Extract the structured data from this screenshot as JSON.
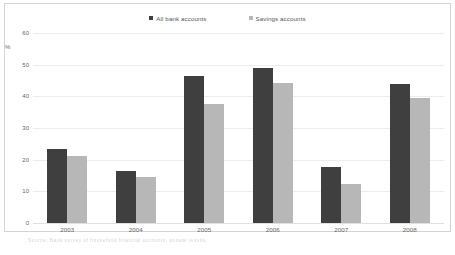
{
  "chart_data": {
    "type": "bar",
    "title": "",
    "subtitle": "",
    "xlabel": "",
    "ylabel": "%",
    "categories": [
      "2003",
      "2004",
      "2005",
      "2006",
      "2007",
      "2008"
    ],
    "series": [
      {
        "name": "All bank accounts",
        "color": "#3f3f3f",
        "values": [
          23.5,
          16.5,
          46.4,
          49.0,
          17.8,
          44.0
        ]
      },
      {
        "name": "Savings accounts",
        "color": "#b7b7b7",
        "values": [
          21.3,
          14.5,
          37.7,
          44.2,
          12.4,
          39.6
        ]
      }
    ],
    "ylim": [
      0,
      60
    ],
    "yticks": [
      0,
      10,
      20,
      30,
      40,
      50,
      60
    ],
    "ytick_labels": [
      "0",
      "10",
      "20",
      "30",
      "40",
      "50",
      "60"
    ],
    "grid": true,
    "legend_position": "top-center"
  },
  "legend": {
    "items": [
      {
        "label": "All bank accounts",
        "color": "#3f3f3f"
      },
      {
        "label": "Savings accounts",
        "color": "#b7b7b7"
      }
    ]
  },
  "axes": {
    "y_unit": "%"
  },
  "footnote": {
    "text": "Source: Bank survey of household financial accounts, annual results"
  }
}
